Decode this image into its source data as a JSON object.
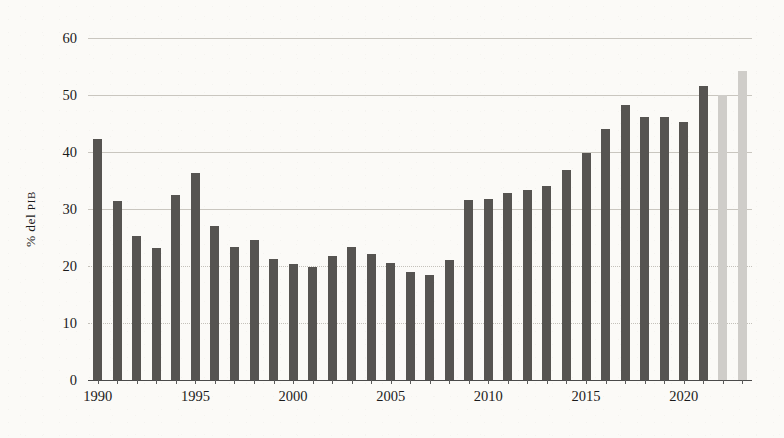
{
  "chart_data": {
    "type": "bar",
    "title": "",
    "subtitle": "",
    "xlabel": "",
    "ylabel": "% del PIB",
    "ylabel_parts": {
      "prefix": "% del ",
      "smallcaps": "PIB"
    },
    "ylim": [
      0,
      60
    ],
    "ytick_step": 10,
    "yticks": [
      0,
      10,
      20,
      30,
      40,
      50,
      60
    ],
    "ytick_labels": [
      "0",
      "10",
      "20",
      "30",
      "40",
      "50",
      "60"
    ],
    "xticks": [
      1990,
      1995,
      2000,
      2005,
      2010,
      2015,
      2020
    ],
    "xtick_labels": [
      "1990",
      "1995",
      "2000",
      "2005",
      "2010",
      "2015",
      "2020"
    ],
    "grid": true,
    "legend": "none",
    "categories": [
      "1990",
      "1991",
      "1992",
      "1993",
      "1994",
      "1995",
      "1996",
      "1997",
      "1998",
      "1999",
      "2000",
      "2001",
      "2002",
      "2003",
      "2004",
      "2005",
      "2006",
      "2007",
      "2008",
      "2009",
      "2010",
      "2011",
      "2012",
      "2013",
      "2014",
      "2015",
      "2016",
      "2017",
      "2018",
      "2019",
      "2020",
      "2021",
      "2022"
    ],
    "values": [
      42.3,
      31.4,
      25.2,
      23.2,
      32.4,
      36.3,
      27.0,
      23.4,
      24.6,
      21.2,
      20.4,
      19.8,
      21.8,
      23.4,
      22.1,
      20.6,
      19.0,
      18.5,
      21.0,
      31.5,
      31.7,
      32.8,
      33.3,
      34.0,
      36.8,
      39.9,
      44.0,
      48.2,
      46.2,
      46.1,
      45.2,
      51.6,
      50.0
    ],
    "highlight_last": {
      "category": "2022",
      "value": 54.3
    },
    "colors": {
      "bar": "#565451",
      "bar_highlight": "#cfcdc9",
      "grid": "#c9c6bf",
      "axis": "#4a4a4a",
      "text": "#1b1b1b",
      "background": "#fbfaf7"
    }
  }
}
